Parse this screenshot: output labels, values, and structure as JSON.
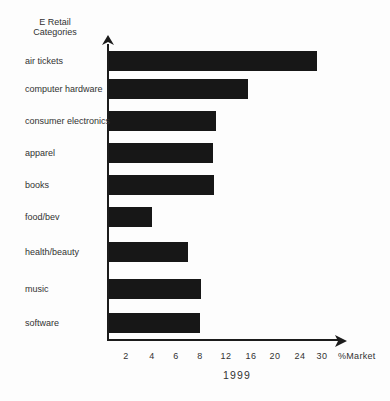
{
  "colors": {
    "background": "#fdfdfd",
    "bar": "#171717",
    "axis": "#1c1c1c",
    "text": "#323232"
  },
  "title": {
    "line1": "E Retail",
    "line2": "Categories"
  },
  "x_axis": {
    "unit_label": "%Market",
    "period_label": "1999"
  },
  "chart_data": {
    "type": "bar",
    "orientation": "horizontal",
    "title": "E Retail Categories",
    "xlabel": "%Market",
    "period": "1999",
    "value_unit": "percent of market",
    "categories": [
      "air tickets",
      "computer hardware",
      "consumer electronics",
      "apparel",
      "books",
      "food/bev",
      "health/beauty",
      "music",
      "software"
    ],
    "values": [
      29,
      16,
      10.5,
      10,
      10,
      4,
      7,
      8,
      8
    ],
    "x_tick_labels": [
      "2",
      "4",
      "6",
      "8",
      "12",
      "16",
      "20",
      "24",
      "30"
    ],
    "grid": false,
    "legend": false,
    "axis_style": "axes drawn as arrows; x tick labels evenly spaced although numeric increments are unequal; no gridlines; solid black bars"
  },
  "render_geometry": {
    "bar_left_px": 109,
    "bar_height_px": 20,
    "bars": [
      {
        "top": 51,
        "width": 208
      },
      {
        "top": 79,
        "width": 139
      },
      {
        "top": 111,
        "width": 107
      },
      {
        "top": 143,
        "width": 104
      },
      {
        "top": 175,
        "width": 105
      },
      {
        "top": 207,
        "width": 43
      },
      {
        "top": 242,
        "width": 79
      },
      {
        "top": 279,
        "width": 92
      },
      {
        "top": 313,
        "width": 91
      }
    ],
    "ticks": [
      {
        "label": "2",
        "x": 126
      },
      {
        "label": "4",
        "x": 152
      },
      {
        "label": "6",
        "x": 176
      },
      {
        "label": "8",
        "x": 200
      },
      {
        "label": "12",
        "x": 226
      },
      {
        "label": "16",
        "x": 251
      },
      {
        "label": "20",
        "x": 275
      },
      {
        "label": "24",
        "x": 300
      },
      {
        "label": "30",
        "x": 322
      }
    ]
  }
}
